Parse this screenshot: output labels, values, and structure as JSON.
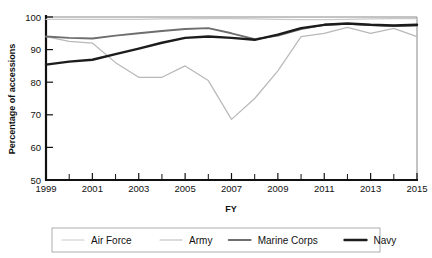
{
  "chart_data": {
    "type": "line",
    "title": "",
    "xlabel": "FY",
    "ylabel": "Percentage of accessions",
    "xlim": [
      1999,
      2015
    ],
    "ylim": [
      50,
      100
    ],
    "ytick_labels": [
      "50",
      "60",
      "70",
      "80",
      "90",
      "100"
    ],
    "yticks": [
      50,
      60,
      70,
      80,
      90,
      100
    ],
    "xtick_labels": [
      "1999",
      "2001",
      "2003",
      "2005",
      "2007",
      "2009",
      "2011",
      "2013",
      "2015"
    ],
    "xticks": [
      1999,
      2001,
      2003,
      2005,
      2007,
      2009,
      2011,
      2013,
      2015
    ],
    "xticks_minor": [
      2000,
      2002,
      2004,
      2006,
      2008,
      2010,
      2012,
      2014
    ],
    "grid": false,
    "legend_position": "bottom",
    "x": [
      1999,
      2000,
      2001,
      2002,
      2003,
      2004,
      2005,
      2006,
      2007,
      2008,
      2009,
      2010,
      2011,
      2012,
      2013,
      2014,
      2015
    ],
    "series": [
      {
        "name": "Air Force",
        "color": "#c9c9c9",
        "width": 1.2,
        "values": [
          99.3,
          99.3,
          99.3,
          99.3,
          99.3,
          99.4,
          99.4,
          99.5,
          99.5,
          99.4,
          99.3,
          99.2,
          99.2,
          99.3,
          99.4,
          99.5,
          99.5
        ]
      },
      {
        "name": "Army",
        "color": "#b8b8b8",
        "width": 1.2,
        "values": [
          94.0,
          92.5,
          92.0,
          86.0,
          81.5,
          81.5,
          85.0,
          80.5,
          68.6,
          75.0,
          83.5,
          94.0,
          95.0,
          96.8,
          95.0,
          96.5,
          94.0
        ]
      },
      {
        "name": "Marine Corps",
        "color": "#6e6e6e",
        "width": 1.9,
        "values": [
          94.0,
          93.6,
          93.4,
          94.3,
          95.0,
          95.7,
          96.3,
          96.6,
          95.0,
          93.2,
          94.3,
          96.3,
          97.6,
          97.9,
          97.5,
          97.2,
          97.4
        ]
      },
      {
        "name": "Navy",
        "color": "#1c1c1c",
        "width": 2.4,
        "values": [
          85.4,
          86.3,
          86.9,
          88.6,
          90.3,
          92.1,
          93.6,
          94.0,
          93.6,
          93.0,
          94.6,
          96.6,
          97.6,
          98.0,
          97.6,
          97.4,
          97.6
        ]
      }
    ]
  },
  "legend": {
    "items": [
      {
        "label": "Air Force"
      },
      {
        "label": "Army"
      },
      {
        "label": "Marine Corps"
      },
      {
        "label": "Navy"
      }
    ]
  }
}
